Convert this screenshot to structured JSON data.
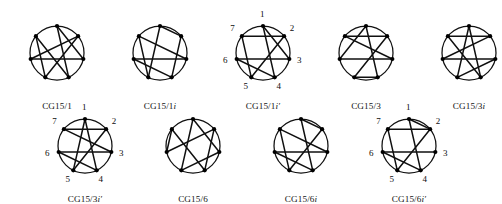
{
  "figure": {
    "vertex_count": 7,
    "vertex_labels": [
      "1",
      "2",
      "3",
      "4",
      "5",
      "6",
      "7"
    ],
    "stroke_color": "#101010",
    "vertex_color": "#000000",
    "background": "#ffffff",
    "rows": [
      {
        "name": "top-row",
        "cells": [
          {
            "id": "cg15-1",
            "caption_main": "CG15/1",
            "caption_suffix": "",
            "caption_prime": "",
            "labels_shown": false,
            "chords": [
              [
                1,
                3
              ],
              [
                2,
                5
              ],
              [
                2,
                6
              ],
              [
                4,
                7
              ],
              [
                5,
                7
              ],
              [
                1,
                4
              ],
              [
                3,
                6
              ]
            ]
          },
          {
            "id": "cg15-1i",
            "caption_main": "CG15/1",
            "caption_suffix": "i",
            "caption_prime": "",
            "labels_shown": false,
            "chords": [
              [
                1,
                2
              ],
              [
                1,
                5
              ],
              [
                2,
                4
              ],
              [
                3,
                6
              ],
              [
                3,
                7
              ],
              [
                4,
                6
              ],
              [
                5,
                7
              ]
            ]
          },
          {
            "id": "cg15-1i-prime",
            "caption_main": "CG15/1",
            "caption_suffix": "i",
            "caption_prime": "′",
            "labels_shown": true,
            "chords": [
              [
                1,
                4
              ],
              [
                2,
                7
              ],
              [
                2,
                5
              ],
              [
                3,
                6
              ],
              [
                3,
                1
              ],
              [
                4,
                6
              ],
              [
                5,
                7
              ]
            ]
          },
          {
            "id": "cg15-3",
            "caption_main": "CG15/3",
            "caption_suffix": "",
            "caption_prime": "",
            "labels_shown": false,
            "chords": [
              [
                1,
                4
              ],
              [
                1,
                6
              ],
              [
                2,
                5
              ],
              [
                2,
                7
              ],
              [
                3,
                6
              ],
              [
                3,
                7
              ],
              [
                4,
                5
              ]
            ]
          },
          {
            "id": "cg15-3i",
            "caption_main": "CG15/3",
            "caption_suffix": "i",
            "caption_prime": "",
            "labels_shown": false,
            "chords": [
              [
                1,
                4
              ],
              [
                1,
                5
              ],
              [
                2,
                7
              ],
              [
                2,
                6
              ],
              [
                3,
                6
              ],
              [
                3,
                5
              ],
              [
                4,
                7
              ]
            ]
          }
        ]
      },
      {
        "name": "bottom-row",
        "cells": [
          {
            "id": "cg15-3i-prime",
            "caption_main": "CG15/3",
            "caption_suffix": "i",
            "caption_prime": "′",
            "labels_shown": true,
            "chords": [
              [
                1,
                4
              ],
              [
                1,
                5
              ],
              [
                2,
                7
              ],
              [
                2,
                5
              ],
              [
                3,
                6
              ],
              [
                3,
                7
              ],
              [
                4,
                6
              ]
            ]
          },
          {
            "id": "cg15-6",
            "caption_main": "CG15/6",
            "caption_suffix": "",
            "caption_prime": "",
            "labels_shown": false,
            "chords": [
              [
                1,
                3
              ],
              [
                1,
                5
              ],
              [
                2,
                6
              ],
              [
                2,
                4
              ],
              [
                3,
                5
              ],
              [
                4,
                7
              ],
              [
                6,
                7
              ]
            ]
          },
          {
            "id": "cg15-6i",
            "caption_main": "CG15/6",
            "caption_suffix": "i",
            "caption_prime": "",
            "labels_shown": false,
            "chords": [
              [
                1,
                2
              ],
              [
                1,
                4
              ],
              [
                2,
                5
              ],
              [
                3,
                6
              ],
              [
                3,
                7
              ],
              [
                4,
                6
              ],
              [
                5,
                7
              ]
            ]
          },
          {
            "id": "cg15-6i-prime",
            "caption_main": "CG15/6",
            "caption_suffix": "i",
            "caption_prime": "′",
            "labels_shown": true,
            "chords": [
              [
                1,
                2
              ],
              [
                1,
                4
              ],
              [
                2,
                5
              ],
              [
                2,
                7
              ],
              [
                3,
                6
              ],
              [
                4,
                6
              ],
              [
                5,
                7
              ]
            ]
          }
        ]
      }
    ]
  }
}
